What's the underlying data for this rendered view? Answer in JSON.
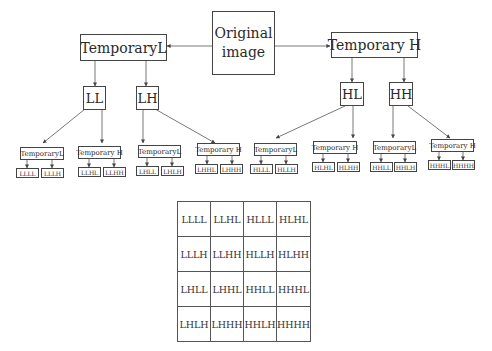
{
  "diagram": {
    "root": {
      "label_line1": "Original",
      "label_line2": "image"
    },
    "level1": [
      {
        "label": "TemporaryL"
      },
      {
        "label": "Temporary H"
      }
    ],
    "level2": [
      {
        "label": "LL"
      },
      {
        "label": "LH"
      },
      {
        "label": "HL"
      },
      {
        "label": "HH"
      }
    ],
    "level3": [
      {
        "label": "TemporaryL"
      },
      {
        "label": "Temporary H"
      },
      {
        "label": "TemporaryL"
      },
      {
        "label": "Temporary H"
      },
      {
        "label": "TemporaryL"
      },
      {
        "label": "Temporary H"
      },
      {
        "label": "TemporaryL"
      },
      {
        "label": "Temporary H"
      }
    ],
    "leaves": [
      "LLLL",
      "LLLH",
      "LLHL",
      "LLHH",
      "LHLL",
      "LHLH",
      "LHHL",
      "LHHH",
      "HLLL",
      "HLLH",
      "HLHL",
      "HLHH",
      "HHLL",
      "HHLH",
      "HHHL",
      "HHHH"
    ]
  },
  "grid": {
    "rows": [
      [
        "LLLL",
        "LLHL",
        "HLLL",
        "HLHL"
      ],
      [
        "LLLH",
        "LLHH",
        "HLLH",
        "HLHH"
      ],
      [
        "LHLL",
        "LHHL",
        "HHLL",
        "HHHL"
      ],
      [
        "LHLH",
        "LHHH",
        "HHLH",
        "HHHH"
      ]
    ]
  }
}
